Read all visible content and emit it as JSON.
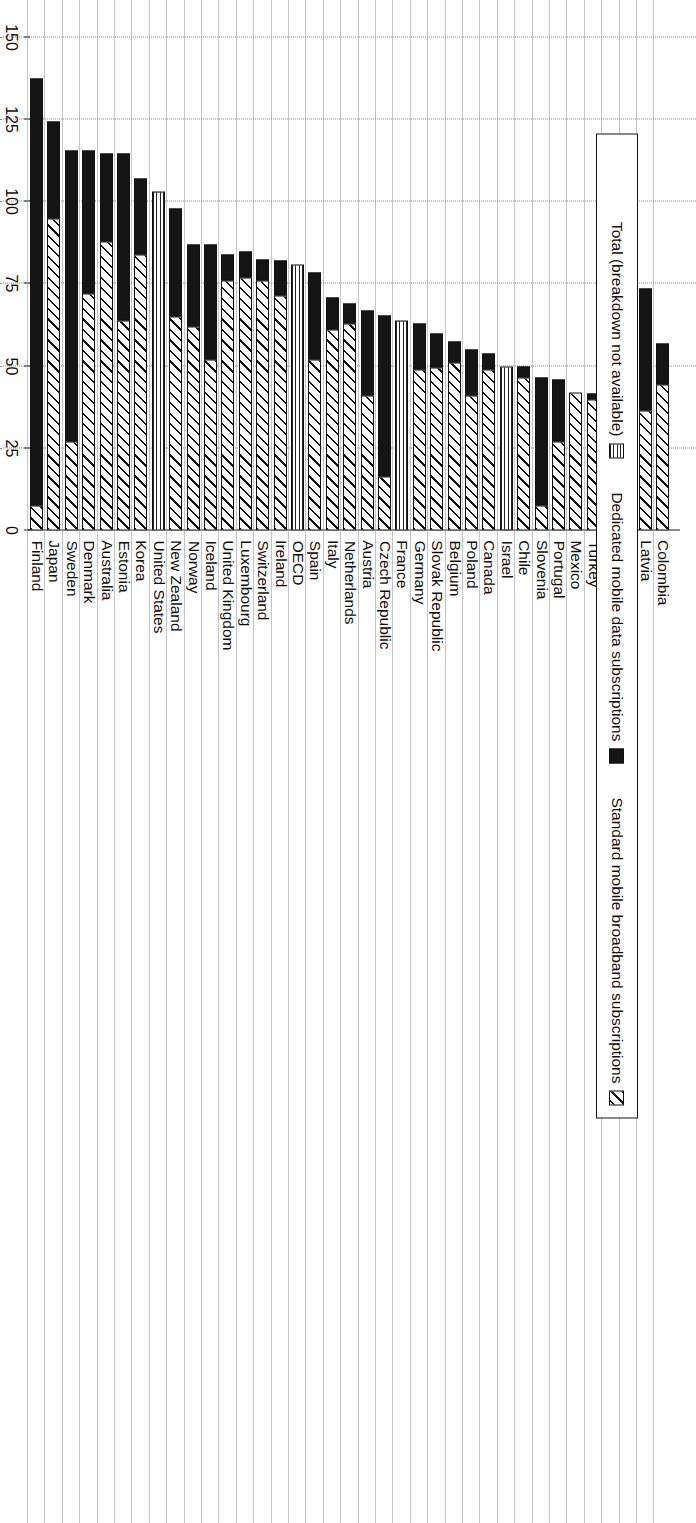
{
  "chart_data": {
    "type": "bar",
    "orientation": "horizontal",
    "title": "",
    "subtitle": "",
    "xlabel": "",
    "ylabel": "",
    "xlim": [
      0,
      150
    ],
    "ticks": [
      0,
      25,
      50,
      75,
      100,
      125,
      150
    ],
    "tick_labels": [
      "0",
      "25",
      "50",
      "75",
      "100",
      "125",
      "150"
    ],
    "grid": true,
    "legend_position": "top-left",
    "legend": [
      {
        "label": "Standard mobile broadband subscriptions",
        "pattern": "diagonal-hatch"
      },
      {
        "label": "Dedicated mobile data subscriptions",
        "pattern": "solid-black"
      },
      {
        "label": "Total (breakdown not available)",
        "pattern": "fine-grid"
      }
    ],
    "series": [
      {
        "name": "Standard mobile broadband subscriptions",
        "key": "standard"
      },
      {
        "name": "Dedicated mobile data subscriptions",
        "key": "dedicated"
      },
      {
        "name": "Total (breakdown not available)",
        "key": "total_only"
      }
    ],
    "categories": [
      "Finland",
      "Japan",
      "Sweden",
      "Denmark",
      "Australia",
      "Estonia",
      "Korea",
      "United States",
      "New Zealand",
      "Norway",
      "Iceland",
      "United Kingdom",
      "Luxembourg",
      "Switzerland",
      "Ireland",
      "OECD",
      "Spain",
      "Italy",
      "Netherlands",
      "Austria",
      "Czech Republic",
      "France",
      "Germany",
      "Slovak Republic",
      "Belgium",
      "Poland",
      "Canada",
      "Israel",
      "Chile",
      "Slovenia",
      "Portugal",
      "Mexico",
      "Turkey",
      "Greece",
      "Hungary",
      "Latvia",
      "Colombia"
    ],
    "data": [
      {
        "category": "Finland",
        "standard": 7.6,
        "dedicated": 129.9,
        "total": 137.5
      },
      {
        "category": "Japan",
        "standard": 95.0,
        "dedicated": 29.5,
        "total": 124.5
      },
      {
        "category": "Sweden",
        "standard": 27.0,
        "dedicated": 88.6,
        "total": 115.6
      },
      {
        "category": "Denmark",
        "standard": 72.0,
        "dedicated": 43.6,
        "total": 115.6
      },
      {
        "category": "Australia",
        "standard": 88.0,
        "dedicated": 26.7,
        "total": 114.7
      },
      {
        "category": "Estonia",
        "standard": 64.0,
        "dedicated": 50.7,
        "total": 114.7
      },
      {
        "category": "Korea",
        "standard": 84.0,
        "dedicated": 23.0,
        "total": 107.0
      },
      {
        "category": "United States",
        "standard": null,
        "dedicated": null,
        "total": 103.0,
        "total_only": true
      },
      {
        "category": "New Zealand",
        "standard": 65.0,
        "dedicated": 33.0,
        "total": 98.0
      },
      {
        "category": "Norway",
        "standard": 62.0,
        "dedicated": 25.0,
        "total": 87.0
      },
      {
        "category": "Iceland",
        "standard": 52.0,
        "dedicated": 35.0,
        "total": 87.0
      },
      {
        "category": "United Kingdom",
        "standard": 76.0,
        "dedicated": 8.0,
        "total": 84.0
      },
      {
        "category": "Luxembourg",
        "standard": 77.0,
        "dedicated": 8.0,
        "total": 85.0
      },
      {
        "category": "Switzerland",
        "standard": 76.0,
        "dedicated": 6.5,
        "total": 82.5
      },
      {
        "category": "Ireland",
        "standard": 71.5,
        "dedicated": 10.5,
        "total": 82.0
      },
      {
        "category": "OECD",
        "standard": null,
        "dedicated": null,
        "total": 81.0,
        "total_only": true
      },
      {
        "category": "Spain",
        "standard": 52.0,
        "dedicated": 26.5,
        "total": 78.5
      },
      {
        "category": "Italy",
        "standard": 61.0,
        "dedicated": 10.0,
        "total": 71.0
      },
      {
        "category": "Netherlands",
        "standard": 63.0,
        "dedicated": 6.0,
        "total": 69.0
      },
      {
        "category": "Austria",
        "standard": 41.0,
        "dedicated": 26.0,
        "total": 67.0
      },
      {
        "category": "Czech Republic",
        "standard": 16.4,
        "dedicated": 49.0,
        "total": 65.4
      },
      {
        "category": "France",
        "standard": null,
        "dedicated": null,
        "total": 64.0,
        "total_only": true
      },
      {
        "category": "Germany",
        "standard": 49.0,
        "dedicated": 14.0,
        "total": 63.0
      },
      {
        "category": "Slovak Republic",
        "standard": 49.6,
        "dedicated": 10.4,
        "total": 60.0
      },
      {
        "category": "Belgium",
        "standard": 51.0,
        "dedicated": 6.5,
        "total": 57.5
      },
      {
        "category": "Poland",
        "standard": 41.0,
        "dedicated": 14.0,
        "total": 55.0
      },
      {
        "category": "Canada",
        "standard": 49.0,
        "dedicated": 5.0,
        "total": 54.0
      },
      {
        "category": "Israel",
        "standard": null,
        "dedicated": null,
        "total": 50.0,
        "total_only": true
      },
      {
        "category": "Chile",
        "standard": 46.5,
        "dedicated": 3.5,
        "total": 50.0
      },
      {
        "category": "Slovenia",
        "standard": 7.6,
        "dedicated": 38.9,
        "total": 46.5
      },
      {
        "category": "Portugal",
        "standard": 27.0,
        "dedicated": 19.0,
        "total": 46.0
      },
      {
        "category": "Mexico",
        "standard": 42.0,
        "dedicated": 0.0,
        "total": 42.0
      },
      {
        "category": "Turkey",
        "standard": 40.0,
        "dedicated": 1.7,
        "total": 41.7
      },
      {
        "category": "Greece",
        "standard": 14.6,
        "dedicated": 27.1,
        "total": 41.7
      },
      {
        "category": "Hungary",
        "standard": 18.6,
        "dedicated": 16.4,
        "total": 35.0
      },
      {
        "category": "Latvia",
        "standard": 36.5,
        "dedicated": 37.1,
        "total": 73.6
      },
      {
        "category": "Colombia",
        "standard": 44.4,
        "dedicated": 12.6,
        "total": 57.0
      }
    ]
  }
}
